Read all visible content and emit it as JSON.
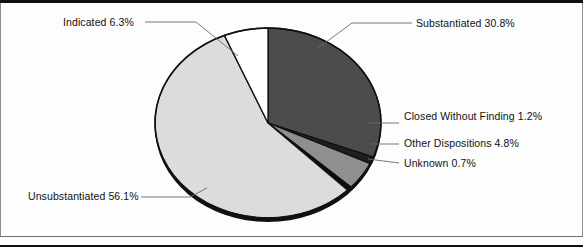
{
  "figure": {
    "background_color": "#fdfdfd",
    "frame_color": "#111111"
  },
  "chart_data": {
    "type": "pie",
    "title": "",
    "subtitle": "",
    "xlabel": "",
    "ylabel": "",
    "legend_position": "none",
    "labels_position": "outside-with-leader-lines",
    "grid": false,
    "start_angle_deg": -90,
    "direction": "clockwise",
    "categories": [
      "Substantiated",
      "Closed Without Finding",
      "Other Dispositions",
      "Unknown",
      "Unsubstantiated",
      "Indicated"
    ],
    "values": [
      30.8,
      1.2,
      4.8,
      0.7,
      56.1,
      6.3
    ],
    "units": "percent",
    "total": 99.9,
    "slices": [
      {
        "name": "Substantiated",
        "value": 30.8,
        "value_text": "30.8%",
        "label": "Substantiated 30.8%",
        "color": "#4c4c4c",
        "edge_color": "#111111"
      },
      {
        "name": "Closed Without Finding",
        "value": 1.2,
        "value_text": "1.2%",
        "label": "Closed Without Finding 1.2%",
        "color": "#1f1f1f",
        "edge_color": "#111111"
      },
      {
        "name": "Other Dispositions",
        "value": 4.8,
        "value_text": "4.8%",
        "label": "Other Dispositions 4.8%",
        "color": "#8f8f8f",
        "edge_color": "#111111"
      },
      {
        "name": "Unknown",
        "value": 0.7,
        "value_text": "0.7%",
        "label": "Unknown 0.7%",
        "color": "#0d0d0d",
        "edge_color": "#111111"
      },
      {
        "name": "Unsubstantiated",
        "value": 56.1,
        "value_text": "56.1%",
        "label": "Unsubstantiated 56.1%",
        "color": "#dcdcdc",
        "edge_color": "#111111"
      },
      {
        "name": "Indicated",
        "value": 6.3,
        "value_text": "6.3%",
        "label": "Indicated 6.3%",
        "color": "#ffffff",
        "edge_color": "#111111"
      }
    ]
  }
}
